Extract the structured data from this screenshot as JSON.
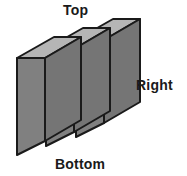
{
  "figure": {
    "kind": "3d-block-diagram",
    "slab_count": 3,
    "colors": {
      "front_face": "#808080",
      "top_face": "#b5b5b5",
      "side_face": "#757575",
      "outline": "#1a1a1a",
      "background": "#ffffff",
      "label_text": "#1a1a1a"
    },
    "labels": {
      "top": "Top",
      "right": "Right",
      "bottom": "Bottom"
    }
  }
}
